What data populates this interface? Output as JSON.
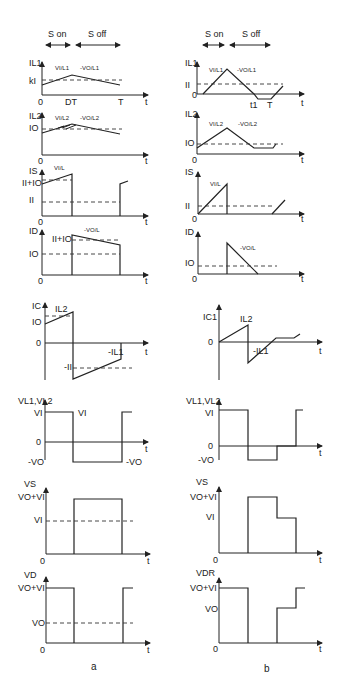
{
  "header": {
    "a": {
      "s_on": "S on",
      "s_off": "S off"
    },
    "b": {
      "s_on": "S on",
      "s_off": "S off"
    }
  },
  "captions": {
    "a": "a",
    "b": "b"
  },
  "axis_t": "t",
  "zero": "0",
  "a": {
    "il1": {
      "ylabel": "IL1",
      "level": "kI",
      "slope_on": "VI/L1",
      "slope_off": "-VO/L1",
      "xticks": [
        "0",
        "DT",
        "T"
      ]
    },
    "il2": {
      "ylabel": "IL2",
      "level": "IO",
      "slope_on": "VI/L2",
      "slope_off": "-VO/L2"
    },
    "is": {
      "ylabel": "IS",
      "peak": "II+IO",
      "level": "II",
      "slope": "VI/L"
    },
    "id": {
      "ylabel": "ID",
      "peak": "II+IO",
      "level": "IO",
      "slope": "-VO/L"
    },
    "ic": {
      "ylabel": "IC",
      "top": "IL2",
      "level": "IO",
      "neg": "-II",
      "neg2": "-IL1"
    },
    "vl": {
      "ylabel": "VL1,VL2",
      "pos": "VI",
      "pos2": "VI",
      "neg": "-VO",
      "neg2": "-VO"
    },
    "vs": {
      "ylabel": "VS",
      "top": "VO+VI",
      "level": "VI"
    },
    "vd": {
      "ylabel": "VD",
      "top": "VO+VI",
      "level": "VO"
    }
  },
  "b": {
    "il1": {
      "ylabel": "IL1",
      "level": "II",
      "slope_on": "VI/L1",
      "slope_off": "-VO/L1",
      "xticks": [
        "0",
        "t1",
        "T"
      ]
    },
    "il2": {
      "ylabel": "IL2",
      "level": "IO",
      "slope_on": "VI/L2",
      "slope_off": "-VO/L2"
    },
    "is": {
      "ylabel": "IS",
      "level": "II",
      "slope": "VI/L"
    },
    "id": {
      "ylabel": "ID",
      "level": "IO",
      "slope": "-VO/L"
    },
    "ic": {
      "ylabel": "IC1",
      "top": "IL2",
      "neg": "-IL1"
    },
    "vl": {
      "ylabel": "VL1,VL2",
      "pos": "VI",
      "neg": "-VO"
    },
    "vs": {
      "ylabel": "VS",
      "top": "VO+VI",
      "level": "VI"
    },
    "vd": {
      "ylabel": "VDR",
      "top": "VO+VI",
      "level": "VO"
    }
  }
}
